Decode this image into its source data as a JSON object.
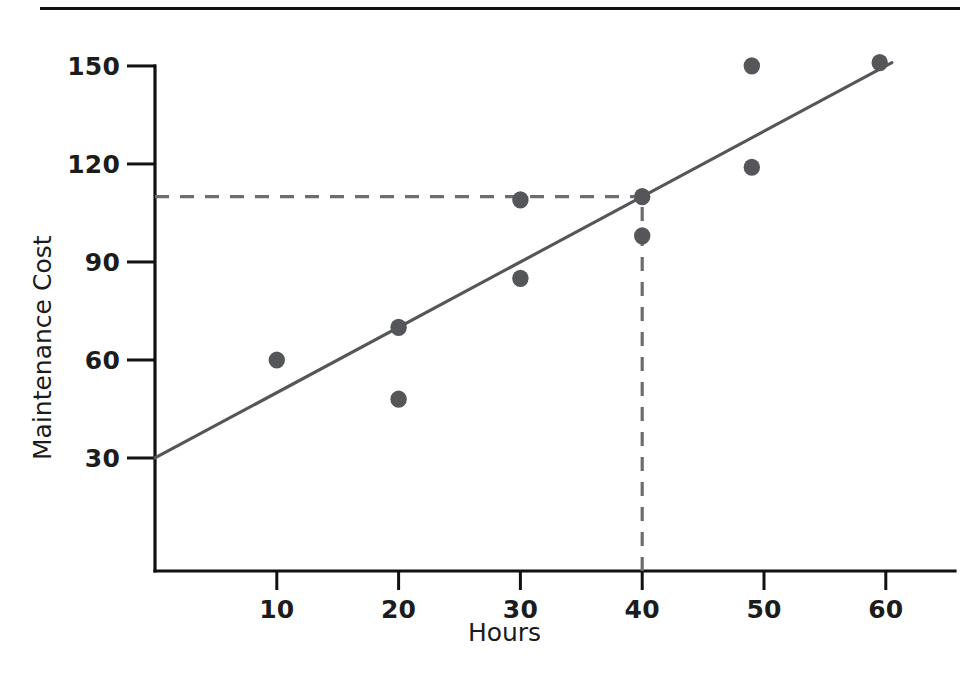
{
  "chart_data": {
    "type": "scatter",
    "title": "",
    "xlabel": "Hours",
    "ylabel": "Maintenance Cost",
    "xlim": [
      0,
      64
    ],
    "ylim": [
      0,
      158
    ],
    "grid": false,
    "legend": "none",
    "x_ticks": [
      10,
      20,
      30,
      40,
      50,
      60
    ],
    "x_tick_labels": [
      "10",
      "20",
      "30",
      "40",
      "50",
      "60"
    ],
    "y_ticks": [
      30,
      60,
      90,
      120,
      150
    ],
    "y_tick_labels": [
      "30",
      "60",
      "90",
      "120",
      "150"
    ],
    "points": [
      {
        "x": 10,
        "y": 60
      },
      {
        "x": 20,
        "y": 70
      },
      {
        "x": 20,
        "y": 48
      },
      {
        "x": 30,
        "y": 109
      },
      {
        "x": 30,
        "y": 85
      },
      {
        "x": 40,
        "y": 110
      },
      {
        "x": 40,
        "y": 98
      },
      {
        "x": 49,
        "y": 150
      },
      {
        "x": 49,
        "y": 119
      },
      {
        "x": 59.5,
        "y": 151
      }
    ],
    "trend_line": {
      "name": "regression-line",
      "x_start": 0,
      "y_start": 30,
      "x_end": 60.5,
      "y_end": 151
    },
    "guides": [
      {
        "name": "horizontal-projection",
        "orientation": "horizontal",
        "y": 110,
        "x_start": 0,
        "x_end": 40,
        "style": "dashed"
      },
      {
        "name": "vertical-projection",
        "orientation": "vertical",
        "x": 40,
        "y_start": 0,
        "y_end": 110,
        "style": "dashed"
      }
    ],
    "colors": {
      "axis": "#111111",
      "marker": "#55565a",
      "trend": "#55565a",
      "guide": "#6c6d72",
      "background": "#ffffff"
    }
  },
  "figure": {
    "top_rule": "",
    "x_axis_title": "Hours",
    "y_axis_title": "Maintenance Cost"
  }
}
